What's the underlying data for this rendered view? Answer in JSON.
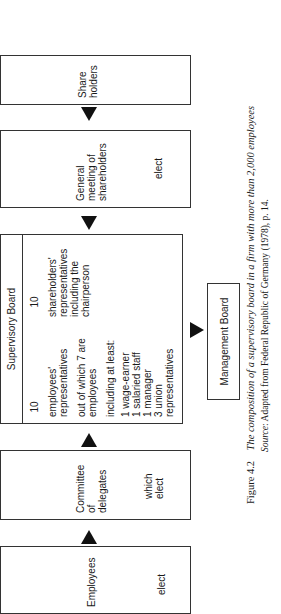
{
  "diagram": {
    "boxes": {
      "employees": {
        "title": "Employees",
        "sub": "elect"
      },
      "committee": {
        "title_lines": [
          "Committee",
          "of",
          "delegates"
        ],
        "sub_lines": [
          "which",
          "elect"
        ]
      },
      "supervisory_board": {
        "header": "Supervisory Board",
        "employee_side": {
          "count": "10",
          "label_lines": [
            "employees'",
            "representatives"
          ],
          "note_lines": [
            "out of which 7 are",
            "employees"
          ],
          "including_label": "including at least:",
          "including_items": [
            "1 wage-earner",
            "1 salaried staff",
            "1 manager",
            "3 union",
            "representatives"
          ]
        },
        "shareholder_side": {
          "count": "10",
          "label_lines": [
            "shareholders'",
            "representatives",
            "including the",
            "chairperson"
          ]
        }
      },
      "general_meeting": {
        "title_lines": [
          "General",
          "meeting of",
          "shareholders"
        ],
        "sub": "elect"
      },
      "shareholders": {
        "title_lines": [
          "Share",
          "holders"
        ]
      },
      "management_board": {
        "title": "Management Board"
      }
    },
    "arrows": [
      {
        "from": "employees",
        "to": "committee"
      },
      {
        "from": "committee",
        "to": "supervisory_board"
      },
      {
        "from": "general_meeting",
        "to": "supervisory_board"
      },
      {
        "from": "shareholders",
        "to": "general_meeting"
      },
      {
        "from": "supervisory_board",
        "to": "management_board"
      }
    ]
  },
  "caption": {
    "figure_label": "Figure 4.2",
    "figure_title": "The composition of a supervisory board in a firm with more than 2,000 employees",
    "source_label": "Source",
    "source_text": ": Adapted from Federal Republic of Germany (1978), p. 14."
  }
}
